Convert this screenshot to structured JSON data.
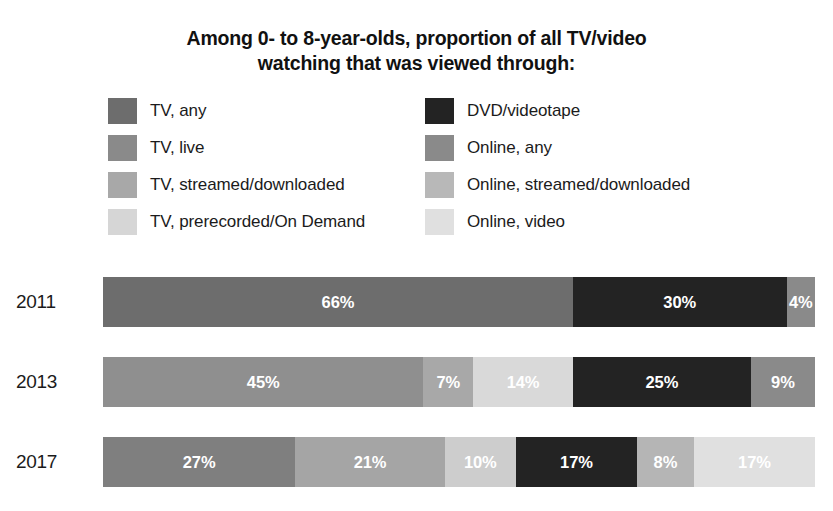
{
  "chart_data": {
    "type": "bar",
    "subtype": "stacked-horizontal-100",
    "title": "Among 0- to 8-year-olds, proportion of all TV/video watching that was viewed through:",
    "title_lines": [
      "Among 0- to 8-year-olds, proportion of all TV/video",
      "watching that was viewed through:"
    ],
    "xlabel": "",
    "ylabel": "",
    "grid": false,
    "legend_position": "top",
    "categories": [
      "2011",
      "2013",
      "2017"
    ],
    "series": [
      {
        "name": "TV, any",
        "color": "#6d6d6d",
        "values": [
          66,
          null,
          null
        ]
      },
      {
        "name": "TV, live",
        "color": "#858585",
        "values": [
          null,
          45,
          27
        ]
      },
      {
        "name": "TV, streamed/downloaded",
        "color": "#a8a8a8",
        "values": [
          null,
          7,
          21
        ]
      },
      {
        "name": "TV, prerecorded/On Demand",
        "color": "#d5d5d5",
        "values": [
          null,
          14,
          10
        ]
      },
      {
        "name": "DVD/videotape",
        "color": "#232323",
        "values": [
          30,
          25,
          17
        ]
      },
      {
        "name": "Online, any",
        "color": "#8a8a8a",
        "values": [
          4,
          9,
          null
        ]
      },
      {
        "name": "Online, streamed/downloaded",
        "color": "#bdbdbd",
        "values": [
          null,
          null,
          8
        ]
      },
      {
        "name": "Online, video",
        "color": "#e2e2e2",
        "values": [
          null,
          null,
          17
        ]
      }
    ],
    "rows": [
      {
        "year": "2011",
        "segments": [
          {
            "series": "TV, any",
            "value": 66,
            "label": "66%",
            "color": "#6d6d6d"
          },
          {
            "series": "DVD/videotape",
            "value": 30,
            "label": "30%",
            "color": "#232323"
          },
          {
            "series": "Online, any",
            "value": 4,
            "label": "4%",
            "color": "#8a8a8a"
          }
        ]
      },
      {
        "year": "2013",
        "segments": [
          {
            "series": "TV, live",
            "value": 45,
            "label": "45%",
            "color": "#8f8f8f"
          },
          {
            "series": "TV, streamed/downloaded",
            "value": 7,
            "label": "7%",
            "color": "#a8a8a8"
          },
          {
            "series": "TV, prerecorded/On Demand",
            "value": 14,
            "label": "14%",
            "color": "#d9d9d9"
          },
          {
            "series": "DVD/videotape",
            "value": 25,
            "label": "25%",
            "color": "#232323"
          },
          {
            "series": "Online, any",
            "value": 9,
            "label": "9%",
            "color": "#8a8a8a"
          }
        ]
      },
      {
        "year": "2017",
        "segments": [
          {
            "series": "TV, live",
            "value": 27,
            "label": "27%",
            "color": "#7f7f7f"
          },
          {
            "series": "TV, streamed/downloaded",
            "value": 21,
            "label": "21%",
            "color": "#a5a5a5"
          },
          {
            "series": "TV, prerecorded/On Demand",
            "value": 10,
            "label": "10%",
            "color": "#cdcdcd"
          },
          {
            "series": "DVD/videotape",
            "value": 17,
            "label": "17%",
            "color": "#232323"
          },
          {
            "series": "Online, streamed/downloaded",
            "value": 8,
            "label": "8%",
            "color": "#b5b5b5"
          },
          {
            "series": "Online, video",
            "value": 17,
            "label": "17%",
            "color": "#e0e0e0"
          }
        ]
      }
    ]
  },
  "legend": {
    "left_column": [
      {
        "label": "TV, any",
        "color": "#6d6d6d"
      },
      {
        "label": "TV, live",
        "color": "#8a8a8a"
      },
      {
        "label": "TV, streamed/downloaded",
        "color": "#a8a8a8"
      },
      {
        "label": "TV, prerecorded/On Demand",
        "color": "#d6d6d6"
      }
    ],
    "right_column": [
      {
        "label": "DVD/videotape",
        "color": "#232323"
      },
      {
        "label": "Online, any",
        "color": "#8a8a8a"
      },
      {
        "label": "Online, streamed/downloaded",
        "color": "#b8b8b8"
      },
      {
        "label": "Online, video",
        "color": "#e0e0e0"
      }
    ]
  }
}
